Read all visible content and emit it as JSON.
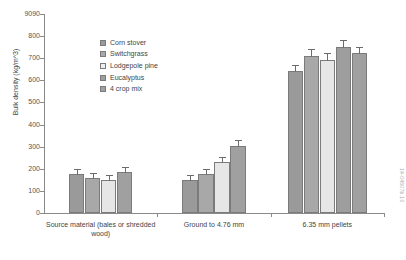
{
  "chart_data": {
    "type": "bar",
    "title": "",
    "xlabel": "",
    "ylabel": "Bulk density (kg/m^3)",
    "ylim": [
      0,
      900
    ],
    "yticks": [
      0,
      100,
      200,
      300,
      400,
      500,
      600,
      700,
      800,
      900
    ],
    "ytick_labels": [
      "0",
      "100",
      "200",
      "300",
      "400",
      "500",
      "600",
      "700",
      "800",
      "9090"
    ],
    "grid": false,
    "legend_position": "upper-left-inside",
    "categories": [
      "Source material (bales or shredded wood)",
      "Ground to 4.76 mm",
      "6.35 mm pellets"
    ],
    "series": [
      {
        "name": "Corn stover",
        "color": "#9a9a9a",
        "values": [
          178,
          150,
          642
        ],
        "errors": [
          5,
          5,
          10
        ]
      },
      {
        "name": "Switchgrass",
        "color": "#a8a8a8",
        "values": [
          160,
          175,
          710
        ],
        "errors": [
          4,
          5,
          14
        ]
      },
      {
        "name": "Lodgepole pine",
        "color": "#e6e6e6",
        "values": [
          148,
          230,
          693
        ],
        "errors": [
          4,
          6,
          12
        ]
      },
      {
        "name": "Eucalyptus",
        "color": "#9e9e9e",
        "values": [
          null,
          null,
          750
        ],
        "errors": [
          0,
          0,
          14
        ]
      },
      {
        "name": "4 crop mix",
        "color": "#a0a0a0",
        "values": [
          185,
          303,
          722
        ],
        "errors": [
          5,
          8,
          12
        ]
      }
    ]
  },
  "legend": {
    "items": [
      {
        "label": "Corn stover",
        "swatch": "#9a9a9a"
      },
      {
        "label": "Switchgrass",
        "swatch": "#a8a8a8"
      },
      {
        "label": "Lodgepole pine",
        "swatch": "#eeeeee"
      },
      {
        "label": "Eucalyptus",
        "swatch": "#9e9e9e"
      },
      {
        "label": "4 crop mix",
        "swatch": "#a0a0a0"
      }
    ]
  },
  "axis": {
    "y_title": "Bulk density (kg/m^3)"
  },
  "watermark": {
    "text": "14-04507b.10"
  }
}
